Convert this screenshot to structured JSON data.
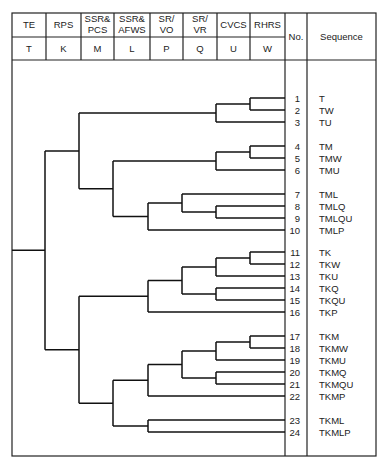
{
  "headers": [
    {
      "event": [
        "TE"
      ],
      "symbol": "T"
    },
    {
      "event": [
        "RPS"
      ],
      "symbol": "K"
    },
    {
      "event": [
        "SSR&",
        "PCS"
      ],
      "symbol": "M"
    },
    {
      "event": [
        "SSR&",
        "AFWS"
      ],
      "symbol": "L"
    },
    {
      "event": [
        "SR/",
        "VO"
      ],
      "symbol": "P"
    },
    {
      "event": [
        "SR/",
        "VR"
      ],
      "symbol": "Q"
    },
    {
      "event": [
        "CVCS"
      ],
      "symbol": "U"
    },
    {
      "event": [
        "RHRS"
      ],
      "symbol": "W"
    }
  ],
  "no_header": "No.",
  "sequence_header": "Sequence",
  "sequences": [
    {
      "no": "1",
      "seq": "T"
    },
    {
      "no": "2",
      "seq": "TW"
    },
    {
      "no": "3",
      "seq": "TU"
    },
    {
      "no": "4",
      "seq": "TM"
    },
    {
      "no": "5",
      "seq": "TMW"
    },
    {
      "no": "6",
      "seq": "TMU"
    },
    {
      "no": "7",
      "seq": "TML"
    },
    {
      "no": "8",
      "seq": "TMLQ"
    },
    {
      "no": "9",
      "seq": "TMLQU"
    },
    {
      "no": "10",
      "seq": "TMLP"
    },
    {
      "no": "11",
      "seq": "TK"
    },
    {
      "no": "12",
      "seq": "TKW"
    },
    {
      "no": "13",
      "seq": "TKU"
    },
    {
      "no": "14",
      "seq": "TKQ"
    },
    {
      "no": "15",
      "seq": "TKQU"
    },
    {
      "no": "16",
      "seq": "TKP"
    },
    {
      "no": "17",
      "seq": "TKM"
    },
    {
      "no": "18",
      "seq": "TKMW"
    },
    {
      "no": "19",
      "seq": "TKMU"
    },
    {
      "no": "20",
      "seq": "TKMQ"
    },
    {
      "no": "21",
      "seq": "TKMQU"
    },
    {
      "no": "22",
      "seq": "TKMP"
    },
    {
      "no": "23",
      "seq": "TKML"
    },
    {
      "no": "24",
      "seq": "TKMLP"
    }
  ],
  "tree": {
    "event": "K",
    "success": {
      "event": "M",
      "success": {
        "event": "U",
        "success": {
          "event": "W",
          "success": 1,
          "failure": 2
        },
        "failure": 3
      },
      "failure": {
        "event": "L",
        "success": {
          "event": "U",
          "success": {
            "event": "W",
            "success": 4,
            "failure": 5
          },
          "failure": 6
        },
        "failure": {
          "event": "P",
          "success": {
            "event": "Q",
            "success": 7,
            "failure": {
              "event": "U",
              "success": 8,
              "failure": 9
            }
          },
          "failure": 10
        }
      }
    },
    "failure": {
      "event": "M",
      "success": {
        "event": "P",
        "success": {
          "event": "Q",
          "success": {
            "event": "U",
            "success": {
              "event": "W",
              "success": 11,
              "failure": 12
            },
            "failure": 13
          },
          "failure": {
            "event": "U",
            "success": 14,
            "failure": 15
          }
        },
        "failure": 16
      },
      "failure": {
        "event": "L",
        "success": {
          "event": "P",
          "success": {
            "event": "Q",
            "success": {
              "event": "U",
              "success": {
                "event": "W",
                "success": 17,
                "failure": 18
              },
              "failure": 19
            },
            "failure": {
              "event": "U",
              "success": 20,
              "failure": 21
            }
          },
          "failure": 22
        },
        "failure": {
          "event": "P",
          "success": 23,
          "failure": 24
        }
      }
    }
  }
}
